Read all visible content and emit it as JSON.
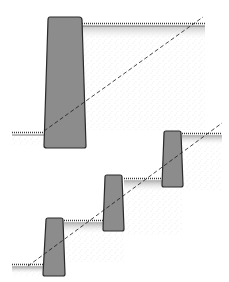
{
  "figure": {
    "panels": [
      {
        "id": "single-wall",
        "description": "One tall retaining wall holding back full slope height",
        "wall_count": 1
      },
      {
        "id": "terraced-walls",
        "description": "Three short stepped walls following the slope line",
        "wall_count": 3
      }
    ]
  },
  "colors": {
    "background": "#ffffff",
    "wall_fill": "#8c8c8c",
    "outline": "#2a2a2a",
    "soil_stipple": "#9a9a9a"
  }
}
